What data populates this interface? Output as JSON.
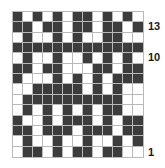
{
  "chart_data": {
    "type": "heatmap",
    "title": "",
    "xlabel": "",
    "ylabel": "",
    "columns": 13,
    "rows": 14,
    "legend": [],
    "colors": {
      "on": "#3c3c3c",
      "off": "#ffffff",
      "gridline": "#b9b9b9",
      "label": "#1a1a1a",
      "background": "#ffffff"
    },
    "row_labels": [
      {
        "text": "13",
        "row_index": 1
      },
      {
        "text": "10",
        "row_index": 4
      },
      {
        "text": "1",
        "row_index": 13
      }
    ],
    "grid": [
      [
        1,
        0,
        1,
        0,
        1,
        0,
        1,
        1,
        0,
        1,
        0,
        1,
        0
      ],
      [
        1,
        1,
        0,
        1,
        1,
        0,
        1,
        1,
        0,
        1,
        1,
        0,
        1
      ],
      [
        0,
        1,
        0,
        0,
        1,
        0,
        1,
        0,
        0,
        1,
        1,
        0,
        0
      ],
      [
        1,
        1,
        1,
        1,
        1,
        1,
        1,
        1,
        1,
        1,
        1,
        1,
        1
      ],
      [
        0,
        1,
        0,
        0,
        1,
        0,
        0,
        1,
        0,
        1,
        0,
        1,
        0
      ],
      [
        1,
        1,
        0,
        1,
        1,
        0,
        0,
        0,
        1,
        1,
        0,
        1,
        1
      ],
      [
        1,
        0,
        0,
        0,
        1,
        0,
        1,
        0,
        1,
        0,
        1,
        1,
        1
      ],
      [
        0,
        0,
        1,
        1,
        1,
        1,
        1,
        0,
        1,
        0,
        1,
        0,
        0
      ],
      [
        0,
        1,
        1,
        1,
        1,
        1,
        1,
        1,
        1,
        1,
        1,
        0,
        0
      ],
      [
        0,
        1,
        0,
        1,
        0,
        1,
        0,
        1,
        0,
        1,
        1,
        0,
        0
      ],
      [
        1,
        0,
        0,
        1,
        0,
        1,
        1,
        1,
        0,
        1,
        0,
        1,
        1
      ],
      [
        1,
        1,
        0,
        1,
        1,
        1,
        0,
        1,
        1,
        1,
        0,
        1,
        1
      ],
      [
        0,
        1,
        0,
        0,
        1,
        0,
        0,
        1,
        0,
        0,
        1,
        0,
        1
      ],
      [
        0,
        1,
        1,
        0,
        1,
        0,
        1,
        1,
        0,
        1,
        1,
        0,
        0
      ]
    ]
  }
}
